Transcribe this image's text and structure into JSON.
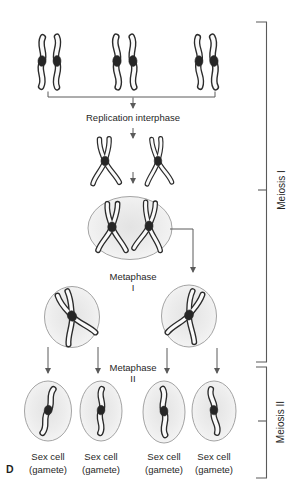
{
  "figure": {
    "panel_label": "D",
    "stage1_label": "Replication interphase",
    "metaphase1": {
      "line1": "Metaphase",
      "line2": "I"
    },
    "metaphase2": {
      "line1": "Metaphase",
      "line2": "II"
    },
    "brackets": {
      "meiosis1": "Meiosis I",
      "meiosis2": "Meiosis II"
    },
    "gametes": [
      {
        "line1": "Sex cell",
        "line2": "(gamete)"
      },
      {
        "line1": "Sex cell",
        "line2": "(gamete)"
      },
      {
        "line1": "Sex cell",
        "line2": "(gamete)"
      },
      {
        "line1": "Sex cell",
        "line2": "(gamete)"
      }
    ],
    "colors": {
      "bg": "#ffffff",
      "text": "#1f1f1f",
      "line": "#5a5a5a",
      "chr_outline": "#2b2b2b",
      "chr_fill": "#fafafa",
      "centromere": "#262626",
      "cell_stroke": "#9a9a9a",
      "cell_fill_center": "#e3e3e3",
      "cell_fill_edge": "#f8f8f8"
    }
  }
}
